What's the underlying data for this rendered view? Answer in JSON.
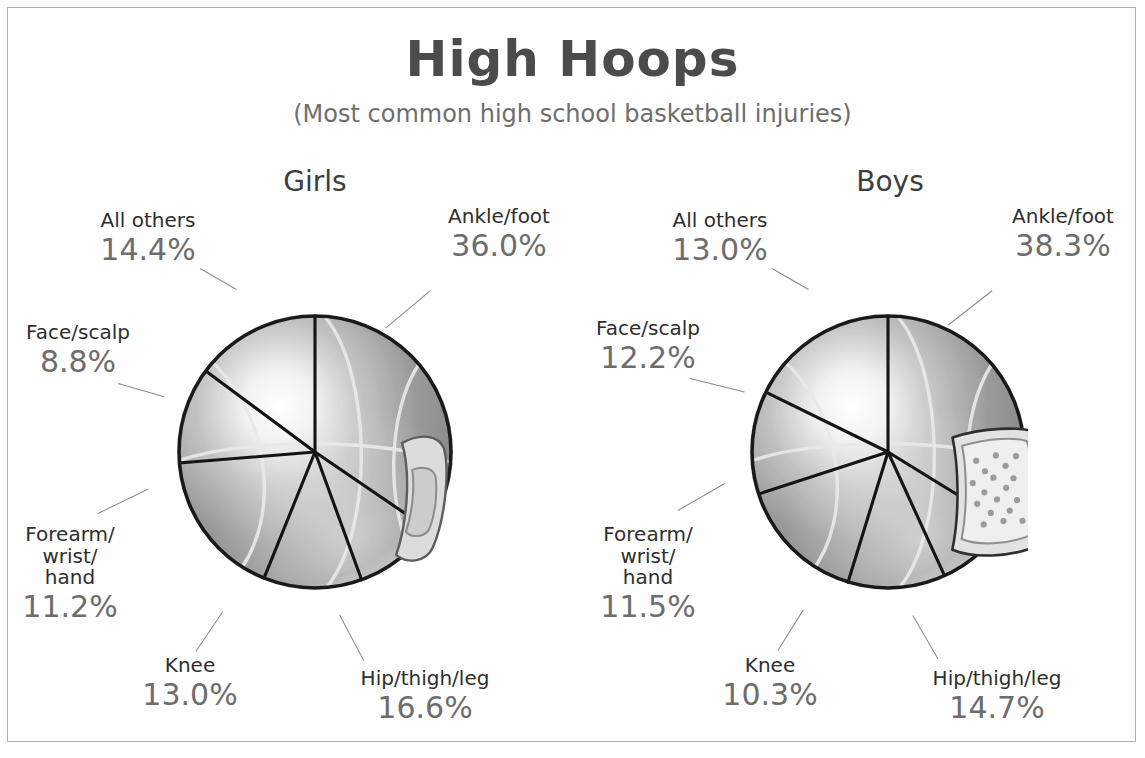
{
  "title": "High Hoops",
  "subtitle": "(Most common high school basketball injuries)",
  "colors": {
    "title_text": "#4b4b4b",
    "subtitle_text": "#6e6e6e",
    "label_text": "#2e2e2e",
    "percent_text": "#6d6d6d",
    "frame_border": "#b0b0b0",
    "background": "#ffffff",
    "ball_outline": "#1a1a1a",
    "ball_seam": "#e6e6e6",
    "wedge_divider": "#141414",
    "bandage_fill": "#d8d8d8",
    "bandage_pad": "#c6c6c6"
  },
  "panels": [
    {
      "id": "girls",
      "title": "Girls",
      "icon": "adhesive-bandage-icon"
    },
    {
      "id": "boys",
      "title": "Boys",
      "icon": "gauze-pad-icon"
    }
  ],
  "chart_data": [
    {
      "type": "pie",
      "title": "Girls",
      "subtitle": "Most common high school basketball injuries",
      "units": "percent",
      "start_angle_deg": 0,
      "direction": "clockwise",
      "legend": "labels-outside-with-leader-lines",
      "categories": [
        "Ankle/foot",
        "Hip/thigh/leg",
        "Knee",
        "Forearm/wrist/hand",
        "Face/scalp",
        "All others"
      ],
      "values": [
        36.0,
        16.6,
        13.0,
        11.2,
        8.8,
        14.4
      ],
      "labels": [
        "36.0%",
        "16.6%",
        "13.0%",
        "11.2%",
        "8.8%",
        "14.4%"
      ]
    },
    {
      "type": "pie",
      "title": "Boys",
      "subtitle": "Most common high school basketball injuries",
      "units": "percent",
      "start_angle_deg": 0,
      "direction": "clockwise",
      "legend": "labels-outside-with-leader-lines",
      "categories": [
        "Ankle/foot",
        "Hip/thigh/leg",
        "Knee",
        "Forearm/wrist/hand",
        "Face/scalp",
        "All others"
      ],
      "values": [
        38.3,
        14.7,
        10.3,
        11.5,
        12.2,
        13.0
      ],
      "labels": [
        "38.3%",
        "14.7%",
        "10.3%",
        "11.5%",
        "12.2%",
        "13.0%"
      ]
    }
  ],
  "girls": {
    "ankle": {
      "name": "Ankle/foot",
      "pct": "36.0%"
    },
    "hip": {
      "name": "Hip/thigh/leg",
      "pct": "16.6%"
    },
    "knee": {
      "name": "Knee",
      "pct": "13.0%"
    },
    "forearm": {
      "name": "Forearm/\nwrist/\nhand",
      "pct": "11.2%"
    },
    "face": {
      "name": "Face/scalp",
      "pct": "8.8%"
    },
    "others": {
      "name": "All others",
      "pct": "14.4%"
    }
  },
  "boys": {
    "ankle": {
      "name": "Ankle/foot",
      "pct": "38.3%"
    },
    "hip": {
      "name": "Hip/thigh/leg",
      "pct": "14.7%"
    },
    "knee": {
      "name": "Knee",
      "pct": "10.3%"
    },
    "forearm": {
      "name": "Forearm/\nwrist/\nhand",
      "pct": "11.5%"
    },
    "face": {
      "name": "Face/scalp",
      "pct": "12.2%"
    },
    "others": {
      "name": "All others",
      "pct": "13.0%"
    }
  }
}
